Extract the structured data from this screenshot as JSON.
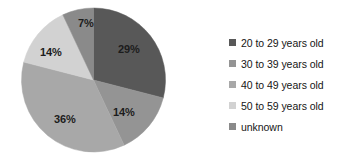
{
  "chart_data": {
    "type": "pie",
    "title": "",
    "categories": [
      "20 to 29 years old",
      "30 to 39 years old",
      "40 to 49 years old",
      "50 to 59 years old",
      "unknown"
    ],
    "values": [
      29,
      14,
      36,
      14,
      7
    ],
    "data_labels": [
      "29%",
      "14%",
      "36%",
      "14%",
      "7%"
    ],
    "colors": [
      "#585858",
      "#949494",
      "#a8a8a8",
      "#d2d2d2",
      "#8a8a8a"
    ],
    "units": "percent",
    "start_angle_deg": 0,
    "direction": "clockwise",
    "legend_position": "right",
    "grid": false,
    "xlabel": "",
    "ylabel": ""
  },
  "chart": {
    "labels": [
      {
        "text": "29%",
        "left": 118,
        "top": 43
      },
      {
        "text": "14%",
        "left": 113,
        "top": 106
      },
      {
        "text": "36%",
        "left": 54,
        "top": 113
      },
      {
        "text": "14%",
        "left": 40,
        "top": 46
      },
      {
        "text": "7%",
        "left": 78,
        "top": 17
      }
    ]
  },
  "legend": {
    "items": [
      {
        "label": "20 to 29 years old",
        "color": "#585858"
      },
      {
        "label": "30 to 39 years old",
        "color": "#949494"
      },
      {
        "label": "40 to 49 years old",
        "color": "#a8a8a8"
      },
      {
        "label": "50 to 59 years old",
        "color": "#d2d2d2"
      },
      {
        "label": "unknown",
        "color": "#8a8a8a"
      }
    ]
  }
}
